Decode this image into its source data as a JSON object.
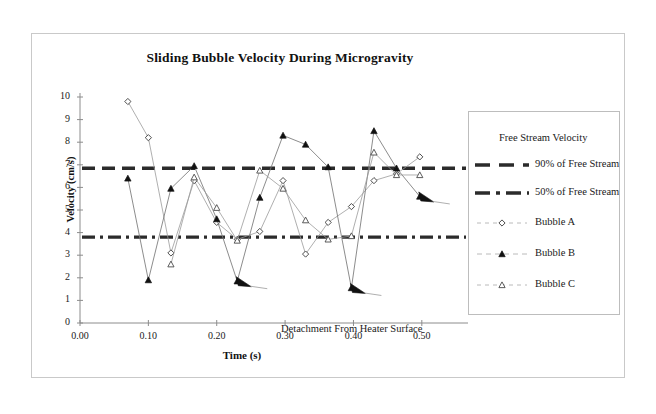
{
  "figure": {
    "title": "Sliding Bubble Velocity During Microgravity",
    "annotation": "Detachment From Heater Surface",
    "x_axis_title": "Time (s)",
    "y_axis_title": "Velocity (cm/s)"
  },
  "legend": {
    "title": "Free Stream Velocity",
    "entries": [
      {
        "label": "90% of Free Stream",
        "style": "dashed-thick"
      },
      {
        "label": "50% of Free Stream",
        "style": "dash-dot-thick"
      },
      {
        "label": "Bubble A",
        "style": "open-diamond"
      },
      {
        "label": "Bubble B",
        "style": "filled-triangle"
      },
      {
        "label": "Bubble C",
        "style": "open-triangle"
      }
    ]
  },
  "chart_data": {
    "type": "line",
    "title": "Sliding Bubble Velocity During Microgravity",
    "xlabel": "Time (s)",
    "ylabel": "Velocity (cm/s)",
    "xlim": [
      0.0,
      0.55
    ],
    "ylim": [
      0,
      10
    ],
    "xticks": [
      "0.00",
      "0.10",
      "0.20",
      "0.30",
      "0.40",
      "0.50"
    ],
    "xtick_values": [
      0.0,
      0.1,
      0.2,
      0.3,
      0.4,
      0.5
    ],
    "yticks": [
      "0",
      "1",
      "2",
      "3",
      "4",
      "5",
      "6",
      "7",
      "8",
      "9",
      "10"
    ],
    "ytick_values": [
      0,
      1,
      2,
      3,
      4,
      5,
      6,
      7,
      8,
      9,
      10
    ],
    "grid": false,
    "legend_position": "right",
    "reference_lines": [
      {
        "name": "90% of Free Stream",
        "value": 6.85,
        "style": "dashed-thick"
      },
      {
        "name": "50% of Free Stream",
        "value": 3.8,
        "style": "dash-dot-thick"
      }
    ],
    "series": [
      {
        "name": "Bubble A",
        "marker": "open-diamond",
        "x": [
          0.07,
          0.1,
          0.133,
          0.167,
          0.2,
          0.23,
          0.263,
          0.297,
          0.33,
          0.363,
          0.397,
          0.43,
          0.463,
          0.497
        ],
        "y": [
          9.8,
          8.2,
          3.1,
          6.3,
          4.45,
          3.7,
          4.05,
          6.3,
          3.05,
          4.45,
          5.15,
          6.3,
          6.6,
          7.35
        ],
        "detachment_index": null
      },
      {
        "name": "Bubble B",
        "marker": "filled-triangle",
        "x": [
          0.07,
          0.1,
          0.133,
          0.167,
          0.2,
          0.23,
          0.263,
          0.297,
          0.33,
          0.363,
          0.397,
          0.43,
          0.463,
          0.497
        ],
        "y": [
          6.4,
          1.9,
          5.95,
          6.95,
          4.6,
          1.85,
          5.55,
          8.3,
          7.9,
          6.9,
          1.55,
          8.5,
          6.85,
          5.6
        ],
        "detachment_points": [
          {
            "x": 0.23,
            "y": 1.85
          },
          {
            "x": 0.397,
            "y": 1.55
          },
          {
            "x": 0.497,
            "y": 5.6
          }
        ]
      },
      {
        "name": "Bubble C",
        "marker": "open-triangle",
        "x": [
          0.133,
          0.167,
          0.2,
          0.23,
          0.263,
          0.297,
          0.33,
          0.363,
          0.397,
          0.43,
          0.463,
          0.497
        ],
        "y": [
          2.6,
          6.45,
          5.1,
          3.65,
          6.75,
          5.95,
          4.55,
          3.7,
          3.85,
          7.55,
          6.55,
          6.55
        ],
        "detachment_index": null
      }
    ]
  },
  "colors": {
    "ink": "#1a1a1a",
    "reference_line": "#2b2b2b",
    "frame": "#c9c9c9",
    "background": "#ffffff"
  }
}
